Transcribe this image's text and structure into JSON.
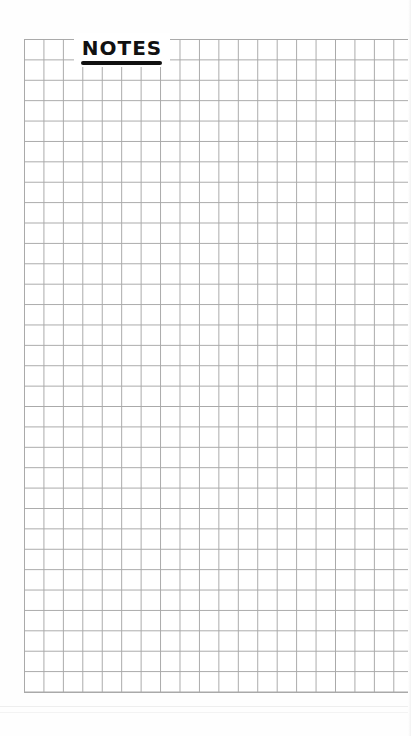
{
  "page": {
    "title": "NOTES",
    "background_color": "#ffffff",
    "grid": {
      "line_color": "#a9a9a9",
      "columns": 20,
      "rows": 32
    }
  }
}
